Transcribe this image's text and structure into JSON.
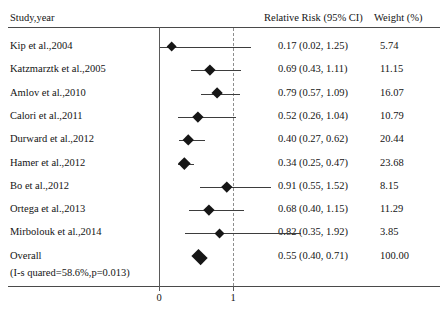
{
  "figure": {
    "type": "forest-plot",
    "headers": {
      "study": "Study,year",
      "effect": "Relative Risk (95% CI)",
      "weight": "Weight (%)"
    },
    "axis": {
      "ticks": [
        "0",
        "1"
      ],
      "tick_values": [
        0,
        1
      ],
      "null_line_value": 1
    },
    "heterogeneity": "(I-s quared=58.6%,p=0.013)",
    "overall_label": "Overall"
  },
  "chart_data": {
    "type": "scatter",
    "title": "",
    "xlabel": "",
    "ylabel": "",
    "xlim": [
      0,
      2.1
    ],
    "grid": false,
    "legend": "none",
    "null_value": 1,
    "measure": "Relative Risk (95% CI)",
    "categories": [
      "Kip et al.,2004",
      "Katzmarztk et al.,2005",
      "Amlov et al.,2010",
      "Calori et al.,2011",
      "Durward et al.,2012",
      "Hamer et al.,2012",
      "Bo et al.,2012",
      "Ortega et al.,2013",
      "Mirbolouk et al.,2014",
      "Overall"
    ],
    "values": [
      0.17,
      0.69,
      0.79,
      0.52,
      0.4,
      0.34,
      0.91,
      0.68,
      0.82,
      0.55
    ],
    "ci_lower": [
      0.02,
      0.43,
      0.57,
      0.26,
      0.27,
      0.25,
      0.55,
      0.4,
      0.35,
      0.4
    ],
    "ci_upper": [
      1.25,
      1.11,
      1.09,
      1.04,
      0.62,
      0.47,
      1.52,
      1.15,
      1.92,
      0.71
    ],
    "weights": [
      5.74,
      11.15,
      16.07,
      10.79,
      20.44,
      23.68,
      8.15,
      11.29,
      3.85,
      100.0
    ]
  },
  "rows": [
    {
      "label": "Kip et al.,2004",
      "rr": "0.17 (0.02, 1.25)",
      "weight": "5.74"
    },
    {
      "label": "Katzmarztk et al.,2005",
      "rr": "0.69 (0.43, 1.11)",
      "weight": "11.15"
    },
    {
      "label": "Amlov et al.,2010",
      "rr": "0.79 (0.57, 1.09)",
      "weight": "16.07"
    },
    {
      "label": "Calori et al.,2011",
      "rr": "0.52 (0.26, 1.04)",
      "weight": "10.79"
    },
    {
      "label": "Durward et al.,2012",
      "rr": "0.40 (0.27, 0.62)",
      "weight": "20.44"
    },
    {
      "label": "Hamer et al.,2012",
      "rr": "0.34 (0.25, 0.47)",
      "weight": "23.68"
    },
    {
      "label": "Bo et al.,2012",
      "rr": "0.91 (0.55, 1.52)",
      "weight": "8.15"
    },
    {
      "label": "Ortega et al.,2013",
      "rr": "0.68 (0.40, 1.15)",
      "weight": "11.29"
    },
    {
      "label": "Mirbolouk et al.,2014",
      "rr": "0.82 (0.35, 1.92)",
      "weight": "3.85"
    },
    {
      "label": "Overall",
      "rr": "0.55 (0.40, 0.71)",
      "weight": "100.00"
    }
  ]
}
